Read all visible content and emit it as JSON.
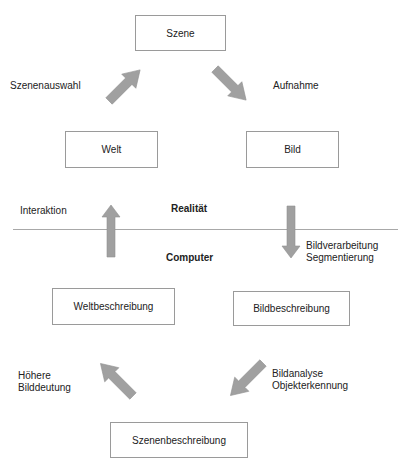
{
  "boxes": {
    "szene": "Szene",
    "welt": "Welt",
    "bild": "Bild",
    "weltbeschreibung": "Weltbeschreibung",
    "bildbeschreibung": "Bildbeschreibung",
    "szenenbeschreibung": "Szenenbeschreibung"
  },
  "edge_labels": {
    "szenenauswahl": "Szenenauswahl",
    "aufnahme": "Aufnahme",
    "interaktion": "Interaktion",
    "bildverarbeitung_1": "Bildverarbeitung",
    "bildverarbeitung_2": "Segmentierung",
    "bildanalyse_1": "Bildanalyse",
    "bildanalyse_2": "Objekterkennung",
    "hoehere_1": "Höhere",
    "hoehere_2": "Bilddeutung"
  },
  "regions": {
    "upper": "Realität",
    "lower": "Computer"
  },
  "colors": {
    "arrow_fill": "#a0a0a0",
    "box_border": "#9a9a9a",
    "divider": "#a8a8a8"
  }
}
